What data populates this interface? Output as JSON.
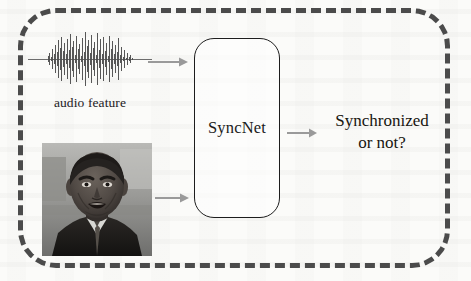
{
  "figure": {
    "name": "syncnet-pipeline-diagram",
    "background_color": "#fbfbf9",
    "frame": {
      "style": "dashed",
      "color": "#4b4b4b",
      "corner_radius_px": 38
    }
  },
  "inputs": {
    "audio": {
      "icon": "audio-waveform-icon",
      "label": "audio feature",
      "color": "#555555"
    },
    "video": {
      "icon": "face-photo-icon",
      "label": "",
      "description": "grayscale photo of a speaking man's face"
    }
  },
  "model": {
    "label": "SyncNet",
    "border_color": "#1d1d1d"
  },
  "output": {
    "line1": "Synchronized",
    "line2": "or not?",
    "color": "#17150f"
  },
  "arrows": {
    "audio_to_model": "arrow-right-icon",
    "video_to_model": "arrow-right-icon",
    "model_to_output": "arrow-right-icon",
    "color": "#9a9a9a"
  }
}
